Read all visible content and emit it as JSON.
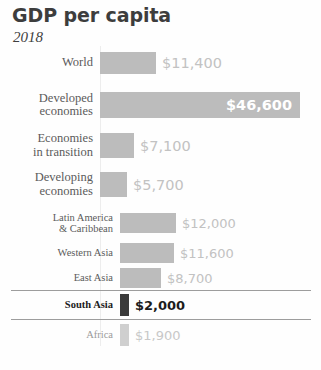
{
  "chart_data": {
    "type": "bar",
    "title": "GDP per capita",
    "subtitle": "2018",
    "xlabel": "",
    "ylabel": "",
    "orientation": "horizontal",
    "value_prefix": "$",
    "grid": false,
    "legend": false,
    "categories": [
      "World",
      "Developed economies",
      "Economies in transition",
      "Developing economies",
      "Latin America & Caribbean",
      "Western Asia",
      "East Asia",
      "South Asia",
      "Africa"
    ],
    "values": [
      11400,
      46600,
      7100,
      5700,
      12000,
      11600,
      8700,
      2000,
      1900
    ],
    "value_labels": [
      "$11,400",
      "$46,600",
      "$7,100",
      "$5,700",
      "$12,000",
      "$11,600",
      "$8,700",
      "$2,000",
      "$1,900"
    ],
    "xlim": [
      0,
      46600
    ],
    "highlighted": "South Asia",
    "colors": {
      "bar": "#bcbcbc",
      "bar_highlight": "#3a3a3a",
      "bar_muted": "#cfcfcf",
      "value_text": "#c2c2c2",
      "value_text_inside": "#ffffff",
      "value_text_highlight": "#1c1c1c",
      "label_text": "#5b5b5b",
      "label_text_highlight": "#1c1c1c",
      "label_text_muted": "#9a9a9a",
      "rule": "#9d9d9d",
      "background": "#fefefe"
    }
  },
  "rows": [
    {
      "label": "World",
      "value_label": "$11,400",
      "bar_px": 56,
      "bar_h": 22,
      "top": 52,
      "left": 100,
      "group": "a",
      "label_pos": "outside",
      "style": "normal"
    },
    {
      "label": "Developed\neconomies",
      "value_label": "$46,600",
      "bar_px": 200,
      "bar_h": 26,
      "top": 92,
      "left": 100,
      "group": "a",
      "label_pos": "inside",
      "style": "normal"
    },
    {
      "label": "Economies\nin transition",
      "value_label": "$7,100",
      "bar_px": 34,
      "bar_h": 25,
      "top": 133,
      "left": 100,
      "group": "a",
      "label_pos": "outside",
      "style": "normal"
    },
    {
      "label": "Developing\neconomies",
      "value_label": "$5,700",
      "bar_px": 27,
      "bar_h": 25,
      "top": 172,
      "left": 100,
      "group": "a",
      "label_pos": "outside",
      "style": "normal"
    },
    {
      "label": "Latin America\n& Caribbean",
      "value_label": "$12,000",
      "bar_px": 56,
      "bar_h": 20,
      "top": 213,
      "left": 120,
      "group": "b",
      "label_pos": "outside",
      "style": "normal"
    },
    {
      "label": "Western Asia",
      "value_label": "$11,600",
      "bar_px": 54,
      "bar_h": 20,
      "top": 243,
      "left": 120,
      "group": "b",
      "label_pos": "outside",
      "style": "normal"
    },
    {
      "label": "East Asia",
      "value_label": "$8,700",
      "bar_px": 41,
      "bar_h": 20,
      "top": 268,
      "left": 120,
      "group": "b",
      "label_pos": "outside",
      "style": "normal"
    },
    {
      "label": "South Asia",
      "value_label": "$2,000",
      "bar_px": 9,
      "bar_h": 22,
      "top": 294,
      "left": 120,
      "group": "b",
      "label_pos": "outside",
      "style": "highlight"
    },
    {
      "label": "Africa",
      "value_label": "$1,900",
      "bar_px": 9,
      "bar_h": 22,
      "top": 324,
      "left": 120,
      "group": "b",
      "label_pos": "outside",
      "style": "muted"
    }
  ],
  "rules": [
    {
      "top": 290
    },
    {
      "top": 319
    }
  ]
}
